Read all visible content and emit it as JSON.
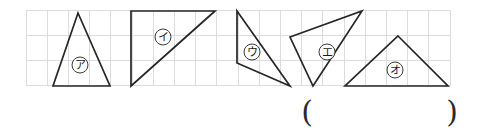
{
  "page": {
    "background_color": "#ffffff"
  },
  "grid": {
    "name": "background-grid",
    "left": 26,
    "top": 10,
    "right": 450,
    "bottom": 86,
    "cell_width": 21.2,
    "cell_height": 25.3,
    "columns": 20,
    "rows": 3,
    "line_color": "#dcdcdc"
  },
  "figures": {
    "stroke_color": "#262626",
    "items": [
      {
        "id": "triangle-a",
        "label": "㋐",
        "label_reading": "ア",
        "label_x": 80,
        "label_y": 65,
        "points": "78,13 110,86 53,86",
        "description": "isosceles triangle pointing up"
      },
      {
        "id": "triangle-i",
        "label": "㋑",
        "label_reading": "イ",
        "label_x": 163,
        "label_y": 37,
        "points": "131,11 215,11 131,86",
        "description": "right triangle with vertical left edge"
      },
      {
        "id": "triangle-u",
        "label": "㋒",
        "label_reading": "ウ",
        "label_x": 252,
        "label_y": 52,
        "points": "237,11 290,86 237,63",
        "description": "narrow scalene triangle"
      },
      {
        "id": "triangle-e",
        "label": "㋓",
        "label_reading": "エ",
        "label_x": 327,
        "label_y": 52,
        "points": "290,37 362,11 313,86",
        "description": "tilted scalene triangle"
      },
      {
        "id": "triangle-o",
        "label": "㋔",
        "label_reading": "オ",
        "label_x": 395,
        "label_y": 70,
        "points": "398,36 448,86 345,86",
        "description": "wide triangle pointing up"
      }
    ]
  },
  "answer_field": {
    "name": "answer-parentheses",
    "open_paren": "(",
    "close_paren": ")",
    "open_x": 307,
    "close_x": 452,
    "baseline_y": 111,
    "value": ""
  }
}
